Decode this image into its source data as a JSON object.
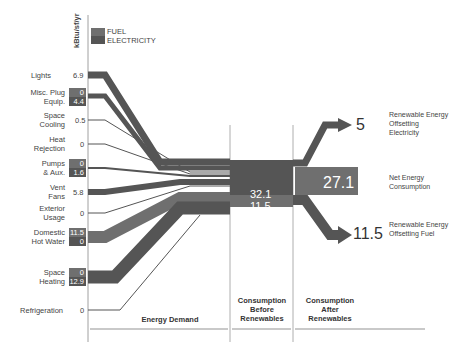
{
  "axis_label": "kBtu/sf/yr",
  "legend": {
    "fuel": "FUEL",
    "electricity": "ELECTRICITY",
    "fuel_color": "#6f6f6f",
    "electricity_color": "#555555"
  },
  "end_uses": [
    {
      "label": "Lights",
      "value": "6.9"
    },
    {
      "label": "Misc. Plug Equip.",
      "fuel": "0",
      "electricity": "4.4"
    },
    {
      "label": "Space Cooling",
      "value": "0.5"
    },
    {
      "label": "Heat Rejection",
      "value": "0"
    },
    {
      "label": "Pumps & Aux.",
      "fuel": "0",
      "electricity": "1.6"
    },
    {
      "label": "Vent Fans",
      "value": "5.8"
    },
    {
      "label": "Exterior Usage",
      "value": "0"
    },
    {
      "label": "Domestic Hot Water",
      "fuel": "11.5",
      "electricity": "0"
    },
    {
      "label": "Space Heating",
      "fuel": "0",
      "electricity": "12.9"
    },
    {
      "label": "Refrigeration",
      "value": "0"
    }
  ],
  "consumption": {
    "electricity": "32.1",
    "fuel": "11.5"
  },
  "net": {
    "value": "27.1",
    "label": "Net Energy Consumption"
  },
  "renewable_electricity": {
    "value": "5",
    "label": "Renewable Energy Offsetting Electricity"
  },
  "renewable_fuel": {
    "value": "11.5",
    "label": "Renewable Energy Offsetting Fuel"
  },
  "sections": {
    "demand": "Energy Demand",
    "before": "Consumption Before Renewables",
    "after": "Consumption After Renewables"
  }
}
